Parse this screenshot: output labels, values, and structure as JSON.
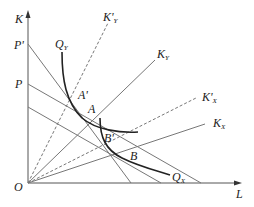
{
  "diagram": {
    "axes": {
      "y_label": "K",
      "x_label": "L",
      "origin_label": "O"
    },
    "intercept_labels": [
      {
        "id": "P_prime",
        "text": "P'",
        "y": 45
      },
      {
        "id": "P",
        "text": "P",
        "y": 85
      }
    ],
    "curves": [
      {
        "id": "QY",
        "label": "Q",
        "sub": "Y",
        "type": "isoquant"
      },
      {
        "id": "QX",
        "label": "Q",
        "sub": "X",
        "type": "isoquant"
      }
    ],
    "rays": [
      {
        "id": "KY",
        "label": "K",
        "sub": "Y",
        "style": "solid"
      },
      {
        "id": "KY_prime",
        "label": "K'",
        "sub": "Y",
        "style": "dashed"
      },
      {
        "id": "KX",
        "label": "K",
        "sub": "X",
        "style": "solid"
      },
      {
        "id": "KX_prime",
        "label": "K'",
        "sub": "X",
        "style": "dashed"
      }
    ],
    "points": [
      {
        "id": "A",
        "label": "A"
      },
      {
        "id": "A_prime",
        "label": "A'"
      },
      {
        "id": "B",
        "label": "B"
      },
      {
        "id": "B_prime",
        "label": "B'"
      }
    ],
    "colors": {
      "line": "#777777",
      "curve": "#222222",
      "text": "#222222"
    }
  }
}
